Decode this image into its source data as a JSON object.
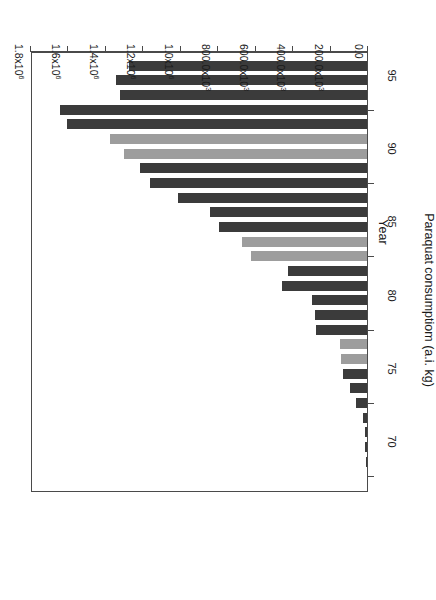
{
  "chart_data": {
    "type": "bar",
    "orientation": "vertical-bars-rendered-rotated-180",
    "title": "",
    "xlabel": "Year",
    "ylabel": "Paraquat consumptiom (a.i. kg)",
    "categories": [
      70,
      71,
      72,
      73,
      74,
      75,
      76,
      77,
      78,
      79,
      80,
      81,
      82,
      83,
      84,
      85,
      86,
      87,
      88,
      89,
      90,
      91,
      92,
      93,
      94,
      95,
      96,
      97,
      98
    ],
    "values": [
      0,
      4000,
      9000,
      13000,
      21000,
      61000,
      88000,
      126000,
      139000,
      146000,
      270000,
      280000,
      295000,
      455000,
      420000,
      620000,
      670000,
      790000,
      840000,
      1010000,
      1160000,
      1210000,
      1300000,
      1370000,
      1600000,
      1640000,
      1320000,
      1340000,
      1270000
    ],
    "bar_colors": [
      "dark",
      "dark",
      "dark",
      "dark",
      "dark",
      "dark",
      "dark",
      "dark",
      "light",
      "light",
      "dark",
      "dark",
      "dark",
      "dark",
      "dark",
      "light",
      "light",
      "dark",
      "dark",
      "dark",
      "dark",
      "dark",
      "light",
      "light",
      "dark",
      "dark",
      "dark",
      "dark",
      "dark"
    ],
    "ylim": [
      0,
      1800000
    ],
    "ytick_values": [
      0,
      200000,
      400000,
      600000,
      800000,
      1000000,
      1200000,
      1400000,
      1600000,
      1800000
    ],
    "ytick_labels": [
      "0.0",
      "200.0x10",
      "400.0x10",
      "600.0x10",
      "800.0x10",
      "1.0x10",
      "1.2x10",
      "1.4x10",
      "1.6x10",
      "1.8x10"
    ],
    "ytick_exponents": [
      "",
      "3",
      "3",
      "3",
      "3",
      "6",
      "6",
      "6",
      "6",
      "6"
    ],
    "xlim": [
      69,
      99
    ],
    "xtick_values": [
      70,
      75,
      80,
      85,
      90,
      95
    ],
    "xtick_labels": [
      "70",
      "75",
      "80",
      "85",
      "90",
      "95"
    ],
    "grid": false,
    "legend": null,
    "colors": {
      "dark_bar": "#3b3b3b",
      "light_bar": "#9d9d9d",
      "axis": "#4a4a4a",
      "background": "#ffffff"
    }
  },
  "axes": {
    "value_axis_title": "Paraquat consumptiom (a.i. kg)",
    "category_axis_title": "Year"
  }
}
